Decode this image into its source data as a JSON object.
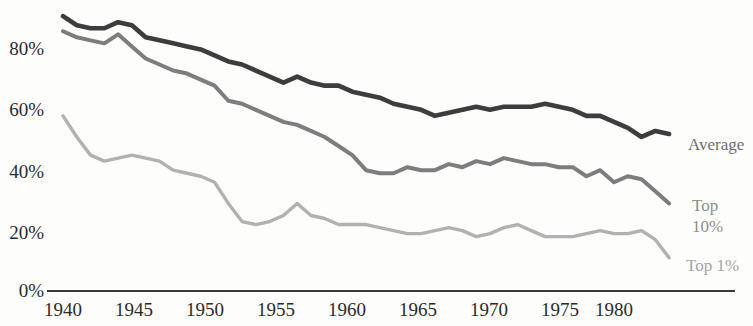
{
  "chart": {
    "type": "line",
    "title": "",
    "subtitle": "",
    "xlabel": "",
    "ylabel": "",
    "grid": false,
    "legend_position": "right-inline",
    "background_color": "#fdfdfc",
    "axis_color": "#3a3a3a",
    "y_axis": {
      "ticks": [
        "0%",
        "20%",
        "40%",
        "60%",
        "80%"
      ],
      "values": [
        0,
        20,
        40,
        60,
        80
      ],
      "min": 0,
      "max": 95
    },
    "x_axis": {
      "ticks": [
        "1940",
        "1945",
        "1950",
        "1955",
        "1960",
        "1965",
        "1970",
        "1975",
        "1980"
      ],
      "values": [
        1940,
        1945,
        1950,
        1955,
        1960,
        1965,
        1970,
        1975,
        1980
      ],
      "min": 1940,
      "max": 1985
    }
  },
  "series_labels": {
    "average": "Average",
    "top10_line1": "Top",
    "top10_line2": "10%",
    "top1": "Top 1%"
  },
  "chart_data": {
    "type": "line",
    "title": "",
    "xlabel": "",
    "ylabel": "",
    "xlim": [
      1940,
      1985
    ],
    "ylim": [
      0,
      95
    ],
    "grid": false,
    "legend_position": "right-inline",
    "x": [
      1940,
      1941,
      1942,
      1943,
      1944,
      1945,
      1946,
      1947,
      1948,
      1949,
      1950,
      1951,
      1952,
      1953,
      1954,
      1955,
      1956,
      1957,
      1958,
      1959,
      1960,
      1961,
      1962,
      1963,
      1964,
      1965,
      1966,
      1967,
      1968,
      1969,
      1970,
      1971,
      1972,
      1973,
      1974,
      1975,
      1976,
      1977,
      1978,
      1979,
      1980,
      1981,
      1982,
      1983,
      1984
    ],
    "series": [
      {
        "name": "Average",
        "color": "#3d3d3d",
        "values": [
          91,
          88,
          87,
          87,
          89,
          88,
          84,
          83,
          82,
          81,
          80,
          78,
          76,
          75,
          73,
          71,
          69,
          71,
          69,
          68,
          68,
          66,
          65,
          64,
          62,
          61,
          60,
          58,
          59,
          60,
          61,
          60,
          61,
          61,
          61,
          62,
          61,
          60,
          58,
          58,
          56,
          54,
          51,
          53,
          52
        ]
      },
      {
        "name": "Top 10%",
        "color": "#7d7d7d",
        "values": [
          86,
          84,
          83,
          82,
          85,
          81,
          77,
          75,
          73,
          72,
          70,
          68,
          63,
          62,
          60,
          58,
          56,
          55,
          53,
          51,
          48,
          45,
          40,
          39,
          39,
          41,
          40,
          40,
          42,
          41,
          43,
          42,
          44,
          43,
          42,
          42,
          41,
          41,
          38,
          40,
          36,
          38,
          37,
          33,
          29
        ]
      },
      {
        "name": "Top 1%",
        "color": "#b1b1b1",
        "values": [
          58,
          51,
          45,
          43,
          44,
          45,
          44,
          43,
          40,
          39,
          38,
          36,
          29,
          23,
          22,
          23,
          25,
          29,
          25,
          24,
          22,
          22,
          22,
          21,
          20,
          19,
          19,
          20,
          21,
          20,
          18,
          19,
          21,
          22,
          20,
          18,
          18,
          18,
          19,
          20,
          19,
          19,
          20,
          17,
          11
        ]
      }
    ],
    "annotations": [
      {
        "text": "Average",
        "series": "Average"
      },
      {
        "text": "Top 10%",
        "series": "Top 10%"
      },
      {
        "text": "Top 1%",
        "series": "Top 1%"
      }
    ]
  }
}
